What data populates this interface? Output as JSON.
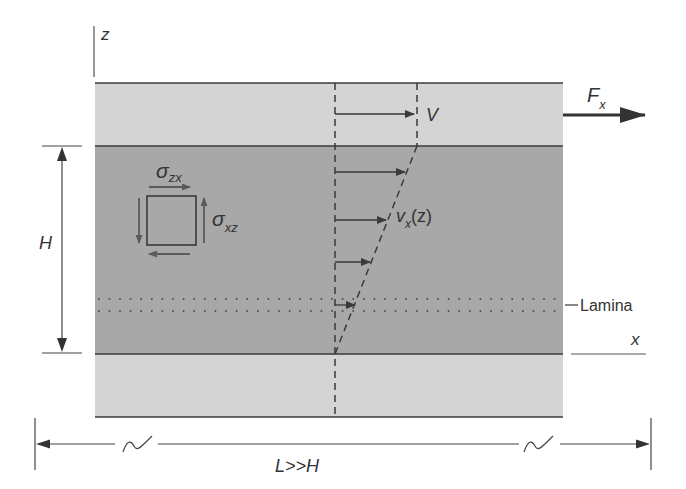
{
  "figure": {
    "type": "shear flow / Couette flow schematic",
    "colors": {
      "background": "#ffffff",
      "plate": "#d4d4d4",
      "fluid": "#a8a8a8",
      "line": "#3a3a3a",
      "stress_arrow": "#5a5a5a",
      "text": "#333333"
    }
  },
  "labels": {
    "z_axis": "z",
    "x_axis": "x",
    "force_symbol": "F",
    "force_sub": "x",
    "plate_velocity": "V",
    "velocity_profile_symbol": "v",
    "velocity_profile_sub": "x",
    "velocity_profile_arg": "(z)",
    "height": "H",
    "length": "L>>H",
    "lamina": "Lamina",
    "stress_zx_symbol": "σ",
    "stress_zx_sub": "zx",
    "stress_xz_symbol": "σ",
    "stress_xz_sub": "xz"
  }
}
